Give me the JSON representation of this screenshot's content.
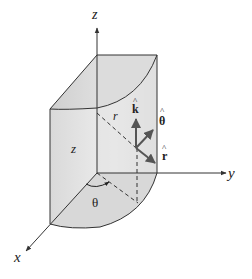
{
  "figure": {
    "axes": {
      "x_label": "x",
      "y_label": "y",
      "z_label": "z"
    },
    "labels": {
      "height": "z",
      "radius": "r",
      "angle": "θ",
      "unit_k": "k",
      "unit_theta": "θ",
      "unit_r": "r",
      "hat": "^"
    },
    "colors": {
      "solid_fill_light": "#e6e6e6",
      "solid_fill_mid": "#d4d4d4",
      "solid_fill_dark": "#c8c8c8",
      "line": "#333333",
      "arrow": "#555555"
    }
  }
}
